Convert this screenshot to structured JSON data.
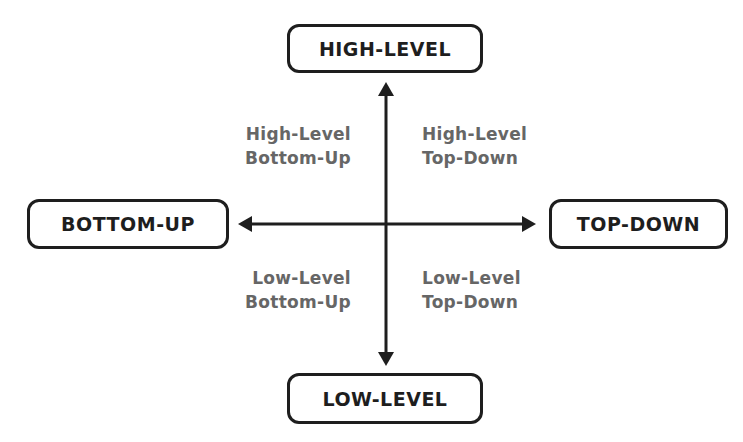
{
  "axes": {
    "top": {
      "label": "HIGH-LEVEL"
    },
    "bottom": {
      "label": "LOW-LEVEL"
    },
    "left": {
      "label": "BOTTOM-UP"
    },
    "right": {
      "label": "TOP-DOWN"
    }
  },
  "quadrants": {
    "top_left": {
      "line1": "High-Level",
      "line2": "Bottom-Up"
    },
    "top_right": {
      "line1": "High-Level",
      "line2": "Top-Down"
    },
    "bottom_left": {
      "line1": "Low-Level",
      "line2": "Bottom-Up"
    },
    "bottom_right": {
      "line1": "Low-Level",
      "line2": "Top-Down"
    }
  },
  "colors": {
    "line": "#1e1e1e",
    "quadrant_text": "#666666",
    "background": "#ffffff"
  }
}
